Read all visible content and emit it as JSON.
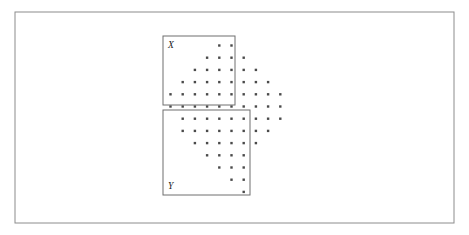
{
  "figure": {
    "background_color": "#ffffff",
    "frame": {
      "name": "outer-frame",
      "x": 15,
      "y": 12,
      "width": 439,
      "height": 211,
      "stroke_color": "#8c8c8c",
      "stroke_width": 1
    },
    "dot": {
      "shape": "square",
      "size": 2.4,
      "color": "#4a4a4a"
    },
    "grid": {
      "origin_x": 170.5,
      "origin_y": 45.5,
      "col_spacing": 12.2,
      "row_spacing": 12.2,
      "description": "Diamond (rhombus) lattice of points arranged on a regular square grid"
    },
    "regions": [
      {
        "name": "region-x",
        "label": "X",
        "label_x": 168,
        "label_y": 48,
        "x": 163,
        "y": 36,
        "width": 72,
        "height": 69,
        "stroke_color": "#6e6e6e"
      },
      {
        "name": "region-y",
        "label": "Y",
        "label_x": 168,
        "label_y": 189,
        "x": 163,
        "y": 110,
        "width": 87,
        "height": 85,
        "stroke_color": "#6e6e6e"
      }
    ]
  },
  "chart_data": {
    "type": "scatter",
    "xlabel": "",
    "ylabel": "",
    "grid": false,
    "legend": null,
    "col_count": 11,
    "row_count": 12,
    "annotations": [
      {
        "text": "X",
        "region": "upper-left rectangle"
      },
      {
        "text": "Y",
        "region": "lower-left rectangle"
      }
    ],
    "rows": [
      {
        "row": 0,
        "y": 45.5,
        "count": 2,
        "cols": [
          4,
          5
        ]
      },
      {
        "row": 1,
        "y": 57.7,
        "count": 4,
        "cols": [
          3,
          4,
          5,
          6
        ]
      },
      {
        "row": 2,
        "y": 69.9,
        "count": 6,
        "cols": [
          2,
          3,
          4,
          5,
          6,
          7
        ]
      },
      {
        "row": 3,
        "y": 82.1,
        "count": 8,
        "cols": [
          1,
          2,
          3,
          4,
          5,
          6,
          7,
          8
        ]
      },
      {
        "row": 4,
        "y": 94.3,
        "count": 10,
        "cols": [
          0,
          1,
          2,
          3,
          4,
          5,
          6,
          7,
          8,
          9
        ]
      },
      {
        "row": 5,
        "y": 106.5,
        "count": 10,
        "cols": [
          0,
          1,
          2,
          3,
          4,
          5,
          6,
          7,
          8,
          9
        ]
      },
      {
        "row": 6,
        "y": 118.7,
        "count": 9,
        "cols": [
          1,
          2,
          3,
          4,
          5,
          6,
          7,
          8,
          9
        ]
      },
      {
        "row": 7,
        "y": 130.9,
        "count": 8,
        "cols": [
          1,
          2,
          3,
          4,
          5,
          6,
          7,
          8
        ]
      },
      {
        "row": 8,
        "y": 143.1,
        "count": 6,
        "cols": [
          2,
          3,
          4,
          5,
          6,
          7
        ]
      },
      {
        "row": 9,
        "y": 155.3,
        "count": 4,
        "cols": [
          3,
          4,
          5,
          6
        ]
      },
      {
        "row": 10,
        "y": 167.5,
        "count": 3,
        "cols": [
          4,
          5,
          6
        ]
      },
      {
        "row": 11,
        "y": 179.7,
        "count": 2,
        "cols": [
          5,
          6
        ]
      },
      {
        "row": 12,
        "y": 191.9,
        "count": 1,
        "cols": [
          6
        ]
      }
    ]
  }
}
